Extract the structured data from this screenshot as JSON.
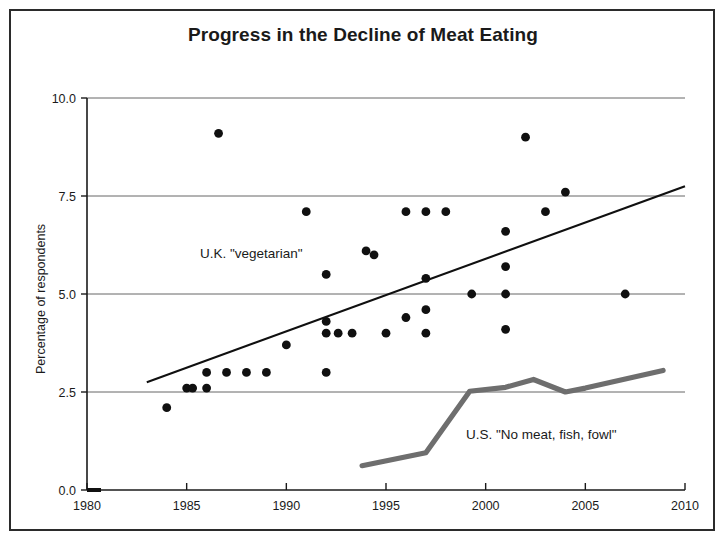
{
  "figure": {
    "title": "Progress in the Decline of Meat Eating",
    "border_color": "#2b2b2b",
    "background": "#ffffff"
  },
  "axes": {
    "y_axis_title": "Percentage of respondents",
    "x_tick_labels": [
      "1980",
      "1985",
      "1990",
      "1995",
      "2000",
      "2005",
      "2010"
    ],
    "y_tick_labels": [
      "0.0",
      "2.5",
      "5.0",
      "7.5",
      "10.0"
    ]
  },
  "annotations": {
    "uk_label": "U.K. \"vegetarian\"",
    "us_label": "U.S. \"No meat, fish, fowl\""
  },
  "chart_data": {
    "type": "scatter",
    "title": "Progress in the Decline of Meat Eating",
    "xlabel": "",
    "ylabel": "Percentage of respondents",
    "xlim": [
      1980,
      2010
    ],
    "ylim": [
      0.0,
      10.0
    ],
    "xticks": [
      1980,
      1985,
      1990,
      1995,
      2000,
      2005,
      2010
    ],
    "yticks": [
      0.0,
      2.5,
      5.0,
      7.5,
      10.0
    ],
    "grid": "horizontal",
    "legend": "none (inline text annotations)",
    "series": [
      {
        "name": "U.K. \"vegetarian\"",
        "type": "scatter",
        "marker": "filled-circle",
        "color": "#101010",
        "points": [
          {
            "x": 1984.0,
            "y": 2.1
          },
          {
            "x": 1985.0,
            "y": 2.6
          },
          {
            "x": 1985.3,
            "y": 2.6
          },
          {
            "x": 1986.0,
            "y": 3.0
          },
          {
            "x": 1986.0,
            "y": 2.6
          },
          {
            "x": 1986.6,
            "y": 9.1
          },
          {
            "x": 1987.0,
            "y": 3.0
          },
          {
            "x": 1988.0,
            "y": 3.0
          },
          {
            "x": 1989.0,
            "y": 3.0
          },
          {
            "x": 1990.0,
            "y": 3.7
          },
          {
            "x": 1991.0,
            "y": 7.1
          },
          {
            "x": 1992.0,
            "y": 5.5
          },
          {
            "x": 1992.0,
            "y": 4.3
          },
          {
            "x": 1992.0,
            "y": 4.0
          },
          {
            "x": 1992.0,
            "y": 3.0
          },
          {
            "x": 1992.6,
            "y": 4.0
          },
          {
            "x": 1993.3,
            "y": 4.0
          },
          {
            "x": 1994.0,
            "y": 6.1
          },
          {
            "x": 1994.4,
            "y": 6.0
          },
          {
            "x": 1995.0,
            "y": 4.0
          },
          {
            "x": 1996.0,
            "y": 7.1
          },
          {
            "x": 1996.0,
            "y": 4.4
          },
          {
            "x": 1997.0,
            "y": 7.1
          },
          {
            "x": 1997.0,
            "y": 5.4
          },
          {
            "x": 1997.0,
            "y": 4.6
          },
          {
            "x": 1997.0,
            "y": 4.0
          },
          {
            "x": 1998.0,
            "y": 7.1
          },
          {
            "x": 1999.3,
            "y": 5.0
          },
          {
            "x": 2001.0,
            "y": 6.6
          },
          {
            "x": 2001.0,
            "y": 5.7
          },
          {
            "x": 2001.0,
            "y": 5.0
          },
          {
            "x": 2001.0,
            "y": 4.1
          },
          {
            "x": 2002.0,
            "y": 9.0
          },
          {
            "x": 2003.0,
            "y": 7.1
          },
          {
            "x": 2004.0,
            "y": 7.6
          },
          {
            "x": 2007.0,
            "y": 5.0
          }
        ]
      },
      {
        "name": "U.K. trend line",
        "type": "line",
        "color": "#101010",
        "points": [
          {
            "x": 1983.0,
            "y": 2.75
          },
          {
            "x": 2010.0,
            "y": 7.75
          }
        ]
      },
      {
        "name": "U.S. \"No meat, fish, fowl\"",
        "type": "line",
        "color": "#6e6e6e",
        "points": [
          {
            "x": 1993.8,
            "y": 0.62
          },
          {
            "x": 1997.0,
            "y": 0.95
          },
          {
            "x": 1999.2,
            "y": 2.52
          },
          {
            "x": 2001.0,
            "y": 2.62
          },
          {
            "x": 2002.4,
            "y": 2.82
          },
          {
            "x": 2004.0,
            "y": 2.5
          },
          {
            "x": 2005.0,
            "y": 2.6
          },
          {
            "x": 2008.9,
            "y": 3.05
          }
        ]
      }
    ]
  }
}
